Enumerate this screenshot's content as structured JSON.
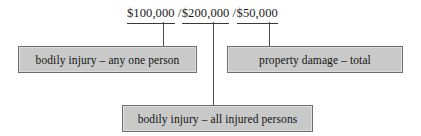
{
  "diagram": {
    "limits": [
      {
        "id": "bodily-person",
        "amount": "$100,000",
        "separator": ""
      },
      {
        "id": "bodily-all",
        "amount": "$200,000",
        "separator": "/"
      },
      {
        "id": "property",
        "amount": "$50,000",
        "separator": "/"
      }
    ],
    "nodes": [
      {
        "id": "bodily-person",
        "label": "bodily injury – any one person"
      },
      {
        "id": "property",
        "label": "property damage – total"
      },
      {
        "id": "bodily-all",
        "label": "bodily injury – all injured persons"
      }
    ],
    "colors": {
      "box_fill": "#c9c9c9",
      "box_border": "#6e6e6e",
      "connector": "#4a4a4a",
      "text": "#141414",
      "background": "#ffffff"
    }
  }
}
